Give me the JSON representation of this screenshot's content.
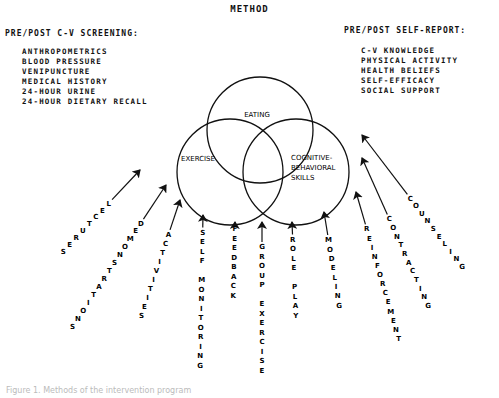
{
  "title": "METHOD",
  "screening": {
    "heading": "PRE/POST C-V SCREENING:",
    "items": [
      "ANTHROPOMETRICS",
      "BLOOD PRESSURE",
      "VENIPUNCTURE",
      "MEDICAL HISTORY",
      "24-HOUR URINE",
      "24-HOUR DIETARY RECALL"
    ]
  },
  "self_report": {
    "heading": "PRE/POST SELF-REPORT:",
    "items": [
      "C-V KNOWLEDGE",
      "PHYSICAL ACTIVITY",
      "HEALTH BELIEFS",
      "SELF-EFFICACY",
      "SOCIAL SUPPORT"
    ]
  },
  "circles": [
    {
      "label": [
        "EATING"
      ]
    },
    {
      "label": [
        "EXERCISE"
      ]
    },
    {
      "label": [
        "COGNITIVE-",
        "BEHAVIORAL",
        "SKILLS"
      ]
    }
  ],
  "interventions": [
    "LECTURES",
    "DEMONSTRATIONS",
    "ACTIVITIES",
    "SELF MONITORING",
    "FEEDBACK",
    "GROUP EXERCISE",
    "ROLE PLAY",
    "MODELING",
    "REINFORCEMENT",
    "CONTRACTING",
    "COUNSELING"
  ],
  "caption": "Figure 1. Methods of the intervention program"
}
